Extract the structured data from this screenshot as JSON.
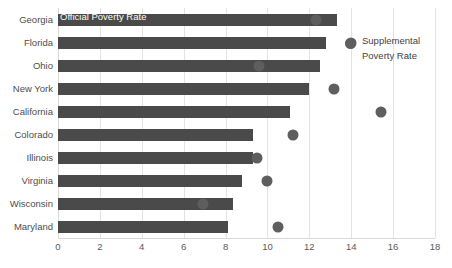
{
  "chart_data": {
    "type": "bar",
    "title": "",
    "subtitle": "",
    "xlabel": "",
    "ylabel": "",
    "xlim": [
      0,
      18
    ],
    "ylim": null,
    "grid": true,
    "orientation": "horizontal",
    "legend_position": "inside-plot",
    "xticks": [
      0,
      2,
      4,
      6,
      8,
      10,
      12,
      14,
      16,
      18
    ],
    "xtick_labels": [
      "0",
      "2",
      "4",
      "6",
      "8",
      "10",
      "12",
      "14",
      "16",
      "18"
    ],
    "categories": [
      "Georgia",
      "Florida",
      "Ohio",
      "New York",
      "California",
      "Colorado",
      "Illinois",
      "Virginia",
      "Wisconsin",
      "Maryland"
    ],
    "series": [
      {
        "name": "Official Poverty Rate",
        "render": "bar",
        "color": "#4a4a4a",
        "values": [
          13.3,
          12.8,
          12.5,
          12.0,
          11.1,
          9.3,
          9.3,
          8.8,
          8.35,
          8.1
        ]
      },
      {
        "name": "Supplemental Poverty Rate",
        "render": "marker",
        "color": "#5e5e5e",
        "values": [
          12.3,
          14.0,
          9.6,
          13.2,
          15.4,
          11.2,
          9.5,
          10.0,
          6.9,
          10.5
        ]
      }
    ],
    "annotations": [
      {
        "text": "Official Poverty Rate",
        "type": "series-label-inside-bar",
        "target": "Georgia"
      },
      {
        "text": "Supplemental Poverty Rate",
        "type": "legend-marker",
        "lines": [
          "Supplemental",
          "Poverty Rate"
        ]
      }
    ]
  },
  "legend": {
    "series1_label": "Official Poverty Rate",
    "series2_line1": "Supplemental",
    "series2_line2": "Poverty Rate"
  },
  "colors": {
    "bar": "#4a4a4a",
    "marker": "#5e5e5e",
    "grid": "#e3e3e3",
    "axis": "#d9d9d9",
    "text": "#4d4d4d",
    "background": "#ffffff"
  }
}
